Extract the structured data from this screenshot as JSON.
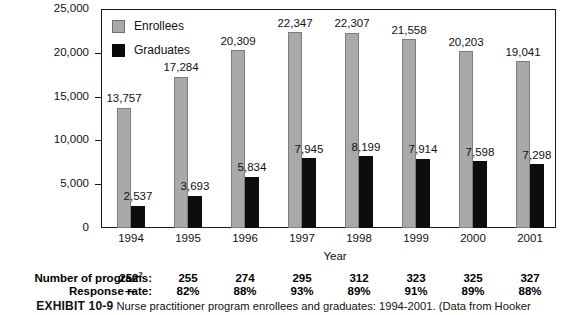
{
  "chart_data": {
    "type": "bar",
    "title": "",
    "xlabel": "Year",
    "ylabel": "",
    "ylim": [
      0,
      25000
    ],
    "ytick_labels": [
      "25,000",
      "20,000",
      "15,000",
      "10,000",
      "5,000",
      "0"
    ],
    "ytick_values": [
      25000,
      20000,
      15000,
      10000,
      5000,
      0
    ],
    "grid": false,
    "legend_position": "upper-left-inside",
    "categories": [
      "1994",
      "1995",
      "1996",
      "1997",
      "1998",
      "1999",
      "2000",
      "2001"
    ],
    "series": [
      {
        "name": "Enrollees",
        "color": "#a9a9a9",
        "values": [
          13757,
          17284,
          20309,
          22347,
          22307,
          21558,
          20203,
          19041
        ],
        "labels": [
          "13,757",
          "17,284",
          "20,309",
          "22,347",
          "22,307",
          "21,558",
          "20,203",
          "19,041"
        ]
      },
      {
        "name": "Graduates",
        "color": "#0d0d0d",
        "values": [
          2537,
          3693,
          5834,
          7945,
          8199,
          7914,
          7598,
          7298
        ],
        "labels": [
          "2,537",
          "3,693",
          "5,834",
          "7,945",
          "8,199",
          "7,914",
          "7,598",
          "7,298"
        ]
      }
    ]
  },
  "legend": {
    "items": [
      {
        "label": "Enrollees",
        "color": "#a9a9a9"
      },
      {
        "label": "Graduates",
        "color": "#0d0d0d"
      }
    ]
  },
  "bottom_table": {
    "rows": [
      {
        "header": "Number of programs:",
        "values": [
          "252",
          "255",
          "274",
          "295",
          "312",
          "323",
          "325",
          "327"
        ],
        "superscripts": [
          "2",
          "",
          "",
          "",
          "",
          "",
          "",
          ""
        ]
      },
      {
        "header": "Response rate:",
        "values": [
          "—",
          "82%",
          "88%",
          "93%",
          "89%",
          "91%",
          "89%",
          "88%"
        ],
        "superscripts": [
          "",
          "",
          "",
          "",
          "",
          "",
          "",
          ""
        ]
      }
    ]
  },
  "caption": {
    "exhibit_number": "EXHIBIT 10-9",
    "text": "Nurse practitioner program enrollees and graduates: 1994-2001. (Data from Hooker"
  }
}
